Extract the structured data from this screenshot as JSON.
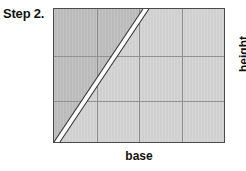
{
  "figure": {
    "step_label": "Step 2.",
    "base_label": "base",
    "height_label": "height",
    "colors": {
      "background": "#ffffff",
      "shape_fill_right": "#d2d2d2",
      "shape_fill_left": "#bdbdbd",
      "outline": "#4a4a4a",
      "grid_line": "#8f8f8f",
      "cut_band_fill": "#ffffff",
      "cut_band_edge": "#3a3a3a",
      "text": "#111111"
    },
    "shape": {
      "type": "rectangle-with-diagonal-cut",
      "grid_columns": 4,
      "grid_rows": 3,
      "cut_from": "bottom-left-corner",
      "cut_to": "top-edge"
    }
  }
}
